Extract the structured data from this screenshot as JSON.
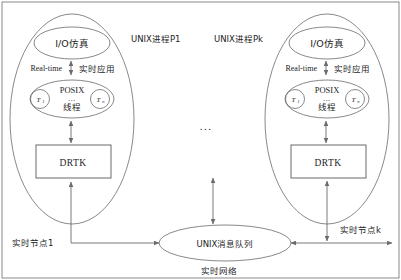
{
  "diagram": {
    "palette": {
      "stroke": "#6b6b6b",
      "text": "#1d1d1d",
      "background": "#ffffff"
    },
    "mid_ellipsis": "...",
    "nodes": [
      {
        "id": "node-1",
        "process_label": "UNIX进程P1",
        "io_label": "I/O仿真",
        "link_left_label": "Real-time",
        "link_right_label": "实时应用",
        "posix_label": "POSIX",
        "posix_dots": "...",
        "thread_label": "线程",
        "thread_first": "T",
        "thread_first_sub": "1",
        "thread_last": "T",
        "thread_last_sub": "n",
        "kernel_label": "DRTK",
        "node_label": "实时节点1"
      },
      {
        "id": "node-k",
        "process_label": "UNIX进程Pk",
        "io_label": "I/O仿真",
        "link_left_label": "Real-time",
        "link_right_label": "实时应用",
        "posix_label": "POSIX",
        "posix_dots": "...",
        "thread_label": "线程",
        "thread_first": "T",
        "thread_first_sub": "1",
        "thread_last": "T",
        "thread_last_sub": "n",
        "kernel_label": "DRTK",
        "node_label": "实时节点k"
      }
    ],
    "bus": {
      "queue_label": "UNIX消息队列",
      "network_label": "实时网络"
    }
  }
}
